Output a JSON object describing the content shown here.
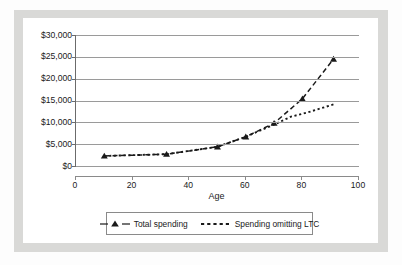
{
  "chart_data": {
    "type": "line",
    "title": "",
    "xlabel": "Age",
    "ylabel": "",
    "xlim": [
      0,
      100
    ],
    "ylim": [
      0,
      30000
    ],
    "grid": true,
    "legend_position": "bottom",
    "x_ticks": [
      "0",
      "20",
      "40",
      "60",
      "80",
      "100"
    ],
    "x_tick_values": [
      0,
      20,
      40,
      60,
      80,
      100
    ],
    "y_ticks": [
      "$0",
      "$5,000",
      "$10,000",
      "$15,000",
      "$20,000",
      "$25,000",
      "$30,000"
    ],
    "y_tick_values": [
      0,
      5000,
      10000,
      15000,
      20000,
      25000,
      30000
    ],
    "series": [
      {
        "name": "Total spending",
        "style": "dashed-with-triangle-markers",
        "x": [
          10,
          32,
          50,
          60,
          70,
          80,
          91
        ],
        "values": [
          2300,
          2700,
          4400,
          6700,
          9800,
          15400,
          24500
        ]
      },
      {
        "name": "Spending omitting LTC",
        "style": "dotted",
        "x": [
          10,
          32,
          50,
          60,
          70,
          76,
          82,
          91
        ],
        "values": [
          2300,
          2700,
          4400,
          6700,
          9500,
          11300,
          12300,
          14100
        ]
      }
    ]
  },
  "legend": {
    "entries": [
      {
        "label": "Total spending",
        "marker": "dashed-triangle-marker"
      },
      {
        "label": "Spending omitting LTC",
        "marker": "dotted-line-marker"
      }
    ]
  },
  "colors": {
    "series_line": "#1a1a1a",
    "gridline": "#9a9a9a",
    "axis": "#6b6b6b",
    "frame": "#d9d9d7",
    "page": "#ffffff"
  }
}
